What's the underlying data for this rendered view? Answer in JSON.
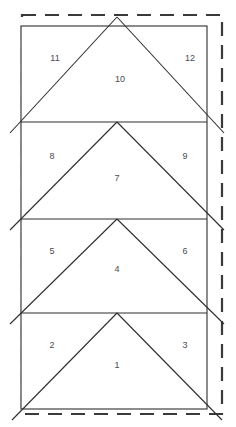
{
  "diagram": {
    "canvas": {
      "width": 236,
      "height": 427
    },
    "colors": {
      "background": "#ffffff",
      "solid_line": "#2e2e2e",
      "dashed_line": "#3a3a3a",
      "label_text": "#4a4a52"
    },
    "cut_boundary": {
      "name": "dashed-cut-boundary",
      "x": 22,
      "y": 15,
      "width": 200,
      "height": 399,
      "dash": "14 9",
      "stroke_width": 2.2
    },
    "panel": {
      "name": "solid-panel-rectangle",
      "x": 21,
      "y": 26,
      "width": 186,
      "height": 383,
      "stroke_width": 1.1
    },
    "dividers": [
      {
        "name": "divider-line-1",
        "y": 122
      },
      {
        "name": "divider-line-2",
        "y": 219
      },
      {
        "name": "divider-line-3",
        "y": 313
      }
    ],
    "bands": [
      {
        "name": "band-top",
        "top": 26,
        "bottom": 122,
        "apex_x": 117,
        "apex_y": 17,
        "left_end_x": 10,
        "left_end_y": 133,
        "right_end_x": 224,
        "right_end_y": 133,
        "center_label": "10",
        "left_label": "11",
        "right_label": "12"
      },
      {
        "name": "band-second",
        "top": 122,
        "bottom": 219,
        "apex_x": 117,
        "apex_y": 122,
        "left_end_x": 10,
        "left_end_y": 230,
        "right_end_x": 224,
        "right_end_y": 230,
        "center_label": "7",
        "left_label": "8",
        "right_label": "9"
      },
      {
        "name": "band-third",
        "top": 219,
        "bottom": 313,
        "apex_x": 117,
        "apex_y": 219,
        "left_end_x": 10,
        "left_end_y": 324,
        "right_end_x": 224,
        "right_end_y": 324,
        "center_label": "4",
        "left_label": "5",
        "right_label": "6"
      },
      {
        "name": "band-bottom",
        "top": 313,
        "bottom": 409,
        "apex_x": 117,
        "apex_y": 313,
        "left_end_x": 12,
        "left_end_y": 420,
        "right_end_x": 222,
        "right_end_y": 420,
        "center_label": "1",
        "left_label": "2",
        "right_label": "3"
      }
    ],
    "labels": [
      {
        "name": "piece-label-11",
        "text": "11",
        "x": 55,
        "y": 61
      },
      {
        "name": "piece-label-12",
        "text": "12",
        "x": 190,
        "y": 61
      },
      {
        "name": "piece-label-10",
        "text": "10",
        "x": 120,
        "y": 82
      },
      {
        "name": "piece-label-8",
        "text": "8",
        "x": 52,
        "y": 159
      },
      {
        "name": "piece-label-9",
        "text": "9",
        "x": 185,
        "y": 159
      },
      {
        "name": "piece-label-7",
        "text": "7",
        "x": 117,
        "y": 181
      },
      {
        "name": "piece-label-5",
        "text": "5",
        "x": 52,
        "y": 254
      },
      {
        "name": "piece-label-6",
        "text": "6",
        "x": 185,
        "y": 254
      },
      {
        "name": "piece-label-4",
        "text": "4",
        "x": 117,
        "y": 272
      },
      {
        "name": "piece-label-2",
        "text": "2",
        "x": 52,
        "y": 348
      },
      {
        "name": "piece-label-3",
        "text": "3",
        "x": 185,
        "y": 348
      },
      {
        "name": "piece-label-1",
        "text": "1",
        "x": 117,
        "y": 368
      }
    ]
  }
}
